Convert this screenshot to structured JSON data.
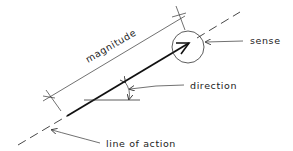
{
  "diagram": {
    "type": "vector-force-diagram",
    "labels": {
      "magnitude": "magnitude",
      "sense": "sense",
      "direction": "direction",
      "line_of_action": "line of action"
    },
    "colors": {
      "stroke": "#222222",
      "background": "#ffffff"
    }
  }
}
